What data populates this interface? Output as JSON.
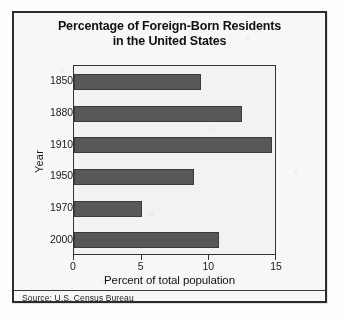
{
  "figure": {
    "title_lines": [
      "Percentage of Foreign-Born Residents",
      "in the United States"
    ],
    "source_note": "Source: U.S. Census Bureau",
    "colors": {
      "bar_fill": "#57585a",
      "bar_edge": "#3a3b3d",
      "frame": "#2b2b2b",
      "plot_background": "#f2f2f1",
      "page_background": "#f7f7f6",
      "text": "#111111"
    }
  },
  "chart_data": {
    "type": "bar",
    "orientation": "horizontal",
    "title": "Percentage of Foreign-Born Residents in the United States",
    "categories": [
      "1850",
      "1880",
      "1910",
      "1950",
      "1970",
      "2000"
    ],
    "values": [
      9.4,
      12.4,
      14.6,
      8.9,
      5.0,
      10.7
    ],
    "xlabel": "Percent of total population",
    "ylabel": "Year",
    "xlim": [
      0,
      15
    ],
    "xticks": [
      0,
      5,
      10,
      15
    ],
    "xtick_labels": [
      "0",
      "5",
      "10",
      "15"
    ],
    "grid": false,
    "legend": null,
    "series": [
      {
        "name": "Percent of total population",
        "values": [
          9.4,
          12.4,
          14.6,
          8.9,
          5.0,
          10.7
        ]
      }
    ],
    "annotations": [
      "Source: U.S. Census Bureau"
    ]
  }
}
